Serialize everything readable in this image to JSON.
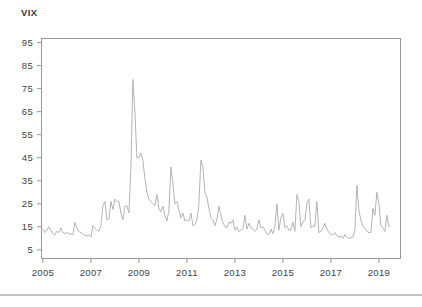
{
  "page": {
    "background": "#ffffff"
  },
  "divider": {
    "color": "#c3c3c3"
  },
  "chart_data": {
    "type": "line",
    "title": "VIX",
    "xlabel": "",
    "ylabel": "",
    "x_unit": "decimal_year, monthly steps",
    "x_start": 2005.0,
    "x_step": 0.0833333,
    "x_end": 2019.42,
    "values": [
      14,
      12.5,
      13.5,
      15,
      13.5,
      12,
      11.5,
      13,
      12.5,
      14.5,
      12.5,
      12,
      12.5,
      12,
      11.8,
      11.5,
      17,
      14.5,
      13,
      12.5,
      12,
      11.2,
      11,
      11.5,
      10.5,
      15.5,
      14.5,
      13.5,
      13,
      15.5,
      24,
      26,
      18,
      18.5,
      26,
      22.5,
      27,
      26,
      26,
      21,
      18,
      24,
      24,
      21,
      40,
      79,
      65,
      45,
      45,
      47,
      44,
      36,
      30,
      27,
      26,
      25,
      24,
      29,
      23,
      21.5,
      24,
      20,
      17.5,
      22,
      41,
      34,
      25,
      26,
      22,
      19,
      21,
      17.5,
      18,
      17.5,
      21,
      15.5,
      16,
      18,
      25,
      44,
      41,
      30,
      28,
      23,
      19,
      18,
      15.5,
      18,
      24,
      20,
      17,
      15,
      14.5,
      17,
      16.5,
      18,
      13.5,
      15,
      13,
      13.5,
      14,
      20,
      14,
      16.5,
      14.5,
      14,
      13,
      14,
      18,
      14.5,
      15,
      13.5,
      12,
      11.5,
      14,
      12,
      15.5,
      25,
      13.5,
      19,
      21,
      14.5,
      15.5,
      13.5,
      13.5,
      17,
      13,
      29,
      26,
      15,
      17,
      18,
      25,
      27,
      14.5,
      15.5,
      15,
      26,
      12.5,
      13,
      14.5,
      16.5,
      14,
      12.5,
      11.5,
      11.5,
      12.5,
      11,
      10.5,
      11,
      10,
      11.5,
      10.5,
      10,
      10.3,
      10.5,
      13.5,
      33,
      22,
      18,
      15,
      14.5,
      13,
      12.5,
      12.5,
      23,
      20,
      30,
      25,
      15.5,
      14.5,
      13,
      20,
      15
    ],
    "xticks": [
      2005,
      2007,
      2009,
      2011,
      2013,
      2015,
      2017,
      2019
    ],
    "yticks": [
      5,
      15,
      25,
      35,
      45,
      55,
      65,
      75,
      85,
      95
    ],
    "xlim": [
      2004.92,
      2019.92
    ],
    "ylim": [
      1,
      97
    ],
    "grid": false,
    "legend": "none",
    "frame": true,
    "line_color": "#b4b4b4",
    "axis_color": "#999999",
    "tick_label_color": "#3f3f3f",
    "title_color": "#3a3a3a",
    "tick_font_size": 9.5
  }
}
